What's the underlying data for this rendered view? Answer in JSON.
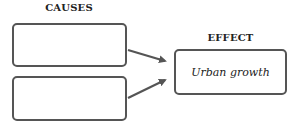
{
  "diagram": {
    "type": "cause-effect organizer",
    "causes": {
      "heading": "CAUSES",
      "boxes": [
        {
          "text": ""
        },
        {
          "text": ""
        }
      ]
    },
    "effect": {
      "heading": "EFFECT",
      "text": "Urban growth"
    },
    "colors": {
      "border": "#555555",
      "text": "#222222",
      "background": "#ffffff"
    }
  }
}
